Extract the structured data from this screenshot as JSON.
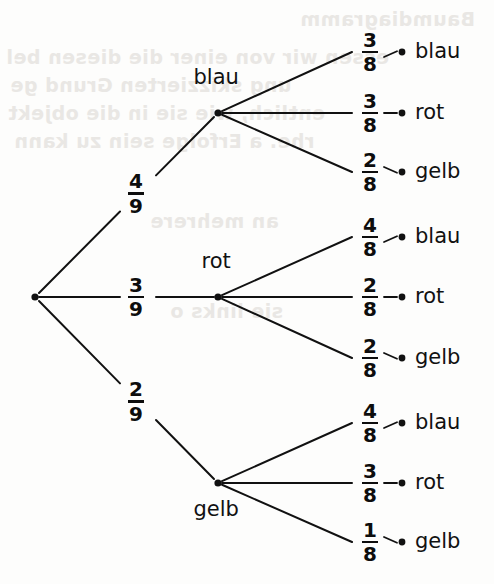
{
  "diagram": {
    "title": "Baumdiagramm",
    "type": "probability-tree",
    "root": {
      "label": "",
      "x": 35,
      "y": 297
    },
    "ink_color": "#111111",
    "background_color": "#fdfdfc",
    "level1": [
      {
        "label": "blau",
        "probability": {
          "numerator": "4",
          "denominator": "9"
        },
        "node_x": 218,
        "node_y": 113,
        "label_position": "above",
        "branches": [
          {
            "label": "blau",
            "numerator": "3",
            "denominator": "8",
            "leaf_y": 52
          },
          {
            "label": "rot",
            "numerator": "3",
            "denominator": "8",
            "leaf_y": 113
          },
          {
            "label": "gelb",
            "numerator": "2",
            "denominator": "8",
            "leaf_y": 172
          }
        ]
      },
      {
        "label": "rot",
        "probability": {
          "numerator": "3",
          "denominator": "9"
        },
        "node_x": 218,
        "node_y": 297,
        "label_position": "above",
        "branches": [
          {
            "label": "blau",
            "numerator": "4",
            "denominator": "8",
            "leaf_y": 237
          },
          {
            "label": "rot",
            "numerator": "2",
            "denominator": "8",
            "leaf_y": 297
          },
          {
            "label": "gelb",
            "numerator": "2",
            "denominator": "8",
            "leaf_y": 358
          }
        ]
      },
      {
        "label": "gelb",
        "probability": {
          "numerator": "2",
          "denominator": "9"
        },
        "node_x": 218,
        "node_y": 483,
        "label_position": "below",
        "branches": [
          {
            "label": "blau",
            "numerator": "4",
            "denominator": "8",
            "leaf_y": 423
          },
          {
            "label": "rot",
            "numerator": "3",
            "denominator": "8",
            "leaf_y": 483
          },
          {
            "label": "gelb",
            "numerator": "1",
            "denominator": "8",
            "leaf_y": 542
          }
        ]
      }
    ],
    "bleed_through_text": [
      {
        "text": "Baumdiagramm",
        "x": 300,
        "y": 8
      },
      {
        "text": "essen wir von einer die diesen bel",
        "x": 6,
        "y": 46
      },
      {
        "text": "ung skizzierten Grund ge",
        "x": 10,
        "y": 74
      },
      {
        "text": "entlich, wie sie in die objekt",
        "x": 8,
        "y": 102
      },
      {
        "text": "rhe. a Erfolge sein zu kann",
        "x": 14,
        "y": 130
      },
      {
        "text": "an mehrere",
        "x": 150,
        "y": 210
      },
      {
        "text": "sie links o",
        "x": 170,
        "y": 300
      }
    ]
  }
}
